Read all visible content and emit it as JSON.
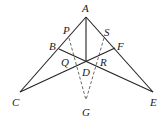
{
  "diagram": {
    "points": {
      "A": {
        "label": "A",
        "x": 86,
        "y": 17
      },
      "B": {
        "label": "B",
        "x": 59,
        "y": 49
      },
      "C": {
        "label": "C",
        "x": 20,
        "y": 92
      },
      "D": {
        "label": "D",
        "x": 86,
        "y": 62
      },
      "E": {
        "label": "E",
        "x": 153,
        "y": 92
      },
      "F": {
        "label": "F",
        "x": 115,
        "y": 48
      },
      "G": {
        "label": "G",
        "x": 86,
        "y": 100
      },
      "P": {
        "label": "P",
        "x": 69,
        "y": 38
      },
      "Q": {
        "label": "Q",
        "x": 74,
        "y": 60
      },
      "R": {
        "label": "R",
        "x": 98,
        "y": 60
      },
      "S": {
        "label": "S",
        "x": 104,
        "y": 38
      }
    },
    "solid_segments": [
      [
        "A",
        "C"
      ],
      [
        "A",
        "E"
      ],
      [
        "A",
        "D"
      ],
      [
        "B",
        "E"
      ],
      [
        "F",
        "C"
      ]
    ],
    "dashed_segments": [
      [
        "P",
        "G"
      ],
      [
        "S",
        "G"
      ]
    ]
  }
}
